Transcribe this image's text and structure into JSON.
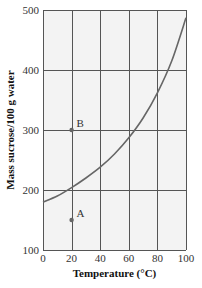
{
  "chart_data": {
    "type": "line",
    "title": "",
    "xlabel": "Temperature (°C)",
    "ylabel": "Mass sucrose/100 g water",
    "xlim": [
      0,
      100
    ],
    "ylim": [
      100,
      500
    ],
    "xticks": [
      0,
      20,
      40,
      60,
      80,
      100
    ],
    "yticks": [
      100,
      200,
      300,
      400,
      500
    ],
    "grid": true,
    "legend": null,
    "series": [
      {
        "name": "Sucrose solubility curve",
        "x": [
          0,
          10,
          20,
          30,
          40,
          50,
          60,
          70,
          80,
          90,
          100
        ],
        "values": [
          180,
          190,
          204,
          220,
          238,
          260,
          287,
          320,
          362,
          415,
          487
        ]
      }
    ],
    "points": [
      {
        "label": "A",
        "x": 20,
        "y": 150
      },
      {
        "label": "B",
        "x": 20,
        "y": 300
      }
    ]
  },
  "colors": {
    "plot_background": "#f3f3f3",
    "grid": "#555555",
    "curve": "#666666",
    "point": "#666666",
    "text": "#333333"
  },
  "layout": {
    "plot_left": 43,
    "plot_right": 186,
    "plot_top": 10,
    "plot_bottom": 250
  }
}
